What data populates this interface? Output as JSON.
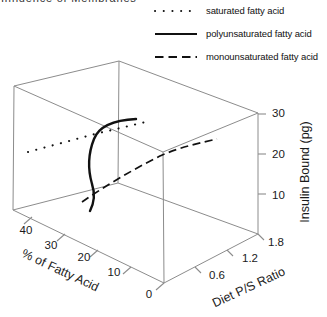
{
  "header": {
    "text": "Influence of Membranes"
  },
  "legend": {
    "items": [
      {
        "label": "saturated fatty acid",
        "style": "dotted"
      },
      {
        "label": "polyunsaturated fatty acid",
        "style": "solid"
      },
      {
        "label": "monounsaturated fatty acid",
        "style": "dashed"
      }
    ]
  },
  "chart_data": {
    "type": "line",
    "projection": "3d-wireframe-box",
    "title": "",
    "axes": {
      "x": {
        "label": "Diet P/S Ratio",
        "ticks": [
          0.6,
          1.2,
          1.8
        ],
        "range": [
          0,
          1.8
        ]
      },
      "y": {
        "label": "% of Fatty Acid",
        "ticks": [
          40,
          30,
          20,
          10,
          0
        ],
        "range": [
          0,
          40
        ]
      },
      "z": {
        "label": "Insulin Bound (pg)",
        "ticks": [
          10,
          20,
          30
        ],
        "range": [
          0,
          30
        ]
      }
    },
    "legend_position": "top-right",
    "grid": false,
    "series": [
      {
        "name": "saturated fatty acid",
        "line_style": "dotted",
        "estimated_points_ps_vs_percent": [
          [
            0.1,
            38
          ],
          [
            0.9,
            38
          ],
          [
            1.8,
            36
          ]
        ]
      },
      {
        "name": "polyunsaturated fatty acid",
        "line_style": "solid",
        "estimated_points_ps_vs_percent": [
          [
            0.1,
            8
          ],
          [
            0.3,
            20
          ],
          [
            0.6,
            27
          ],
          [
            1.2,
            30
          ]
        ]
      },
      {
        "name": "monounsaturated fatty acid",
        "line_style": "dashed",
        "estimated_points_ps_vs_percent": [
          [
            0.2,
            22
          ],
          [
            0.9,
            16
          ],
          [
            1.8,
            12
          ]
        ]
      }
    ]
  },
  "render": {
    "colors": {
      "frame": "#8c8c8c",
      "data": "#111111",
      "text": "#1a1a1a"
    },
    "box_edges": [
      [
        119,
        61,
        14,
        86
      ],
      [
        119,
        61,
        258,
        113
      ],
      [
        119,
        61,
        118,
        183
      ],
      [
        14,
        86,
        163,
        152
      ],
      [
        258,
        113,
        163,
        152
      ],
      [
        14,
        86,
        13,
        210
      ],
      [
        258,
        113,
        258,
        234
      ],
      [
        163,
        152,
        164,
        283
      ],
      [
        118,
        183,
        13,
        210
      ],
      [
        118,
        183,
        258,
        234
      ],
      [
        13,
        210,
        164,
        283
      ],
      [
        258,
        234,
        164,
        283
      ]
    ],
    "ticks": [
      [
        258,
        114,
        266,
        114
      ],
      [
        258,
        154,
        266,
        154
      ],
      [
        258,
        194,
        266,
        194
      ],
      [
        195,
        267,
        201,
        273
      ],
      [
        227,
        250,
        233,
        256
      ],
      [
        258,
        234,
        264,
        240
      ],
      [
        164,
        283,
        156,
        290
      ],
      [
        131,
        267,
        123,
        274
      ],
      [
        98,
        250,
        90,
        257
      ],
      [
        65,
        234,
        57,
        241
      ],
      [
        32,
        217,
        24,
        224
      ]
    ],
    "labels": [
      {
        "name": "fatty-axis-tick-40",
        "t": "40",
        "x": 26,
        "y": 231,
        "r": 0,
        "s": 11.5,
        "a": "middle"
      },
      {
        "name": "fatty-axis-tick-30",
        "t": "30",
        "x": 51,
        "y": 246,
        "r": 0,
        "s": 11.5,
        "a": "middle"
      },
      {
        "name": "fatty-axis-tick-20",
        "t": "20",
        "x": 84,
        "y": 258,
        "r": 0,
        "s": 11.5,
        "a": "middle"
      },
      {
        "name": "fatty-axis-tick-10",
        "t": "10",
        "x": 114,
        "y": 273,
        "r": 0,
        "s": 11.5,
        "a": "middle"
      },
      {
        "name": "fatty-axis-tick-0",
        "t": "0",
        "x": 149,
        "y": 295,
        "r": 0,
        "s": 11.5,
        "a": "middle"
      },
      {
        "name": "diet-axis-tick-06",
        "t": "0.6",
        "x": 217,
        "y": 276,
        "r": 0,
        "s": 11.5,
        "a": "middle"
      },
      {
        "name": "diet-axis-tick-12",
        "t": "1.2",
        "x": 250,
        "y": 259,
        "r": 0,
        "s": 11.5,
        "a": "middle"
      },
      {
        "name": "diet-axis-tick-18",
        "t": "1.8",
        "x": 276,
        "y": 243,
        "r": 0,
        "s": 11.5,
        "a": "middle"
      },
      {
        "name": "insulin-axis-tick-30",
        "t": "30",
        "x": 272,
        "y": 114,
        "r": 0,
        "s": 11.5,
        "a": "start"
      },
      {
        "name": "insulin-axis-tick-20",
        "t": "20",
        "x": 272,
        "y": 155,
        "r": 0,
        "s": 11.5,
        "a": "start"
      },
      {
        "name": "insulin-axis-tick-10",
        "t": "10",
        "x": 272,
        "y": 196,
        "r": 0,
        "s": 11.5,
        "a": "start"
      },
      {
        "name": "fatty-axis-title",
        "t": "% of Fatty Acid",
        "x": 60,
        "y": 271,
        "r": 25,
        "s": 12.5,
        "a": "middle"
      },
      {
        "name": "diet-axis-title",
        "t": "Diet P/S Ratio",
        "x": 249,
        "y": 288,
        "r": -25,
        "s": 12.5,
        "a": "middle"
      },
      {
        "name": "insulin-axis-title",
        "t": "Insulin Bound (pg)",
        "x": 306,
        "y": 172,
        "r": -90,
        "s": 12.5,
        "a": "middle"
      }
    ],
    "series_paths": [
      {
        "name": "series-saturated",
        "d": "M28,152 L95,134 L150,121",
        "w": 2.1,
        "dash": "0.1 8.4",
        "cap": "round"
      },
      {
        "name": "series-polyunsaturated",
        "d": "M136,119 C116,120 99,126 94,139 C88,154 88,170 92,184 C95,193 94,203 90,211",
        "w": 2.4,
        "dash": "",
        "cap": "round"
      },
      {
        "name": "series-monounsaturated",
        "d": "M82,202 C105,186 132,170 160,156 C180,147 200,143 217,139",
        "w": 1.7,
        "dash": "8 4.5",
        "cap": "butt"
      }
    ],
    "legend_dash": {
      "dotted": "0.1 8.6",
      "solid": "",
      "dashed": "8.5 5"
    }
  }
}
